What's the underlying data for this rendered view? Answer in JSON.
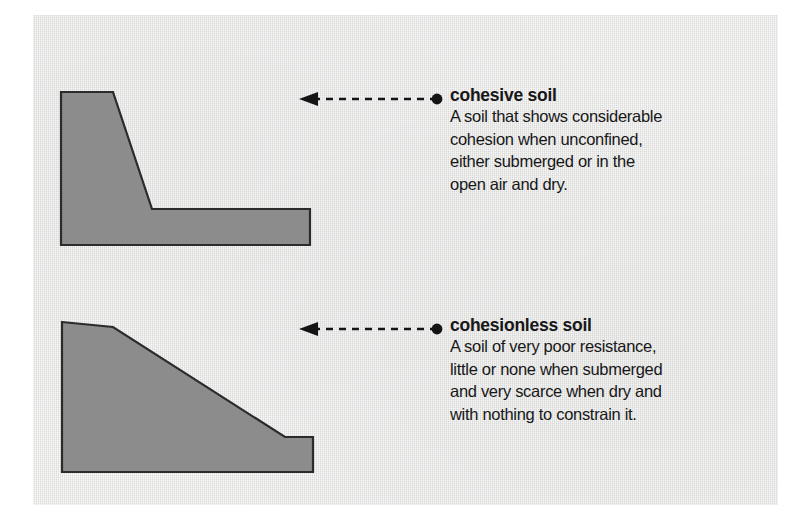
{
  "figure": {
    "name": "soil-types-diagram",
    "panel_background_color": "#e3e3e2",
    "outer_background_color": "#ffffff",
    "soil_fill_color": "#8c8c8c",
    "soil_outline_color": "#2b2b2b",
    "ink_color": "#171717"
  },
  "entries": [
    {
      "id": "cohesive",
      "title": "cohesive soil",
      "body_lines": [
        "A soil that  shows considerable",
        "cohesion  when  unconfined,",
        "either  submerged  or  in  the",
        "open air and dry."
      ],
      "shape_label": "cohesive-soil-profile",
      "connector_label": "cohesive-soil-connector"
    },
    {
      "id": "cohesionless",
      "title": "cohesionless soil",
      "body_lines": [
        "A soil of very poor resistance,",
        "little or none when submerged",
        "and very scarce when dry and",
        "with nothing to constrain it."
      ],
      "shape_label": "cohesionless-soil-profile",
      "connector_label": "cohesionless-soil-connector"
    }
  ]
}
